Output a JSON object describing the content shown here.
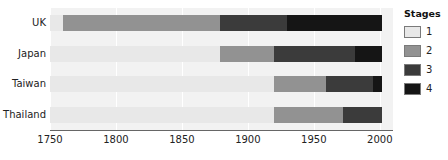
{
  "chart_data": {
    "type": "bar",
    "subtype": "stacked-horizontal-timeline",
    "title": "",
    "xlabel": "",
    "ylabel": "",
    "categories": [
      "UK",
      "Japan",
      "Taiwan",
      "Thailand"
    ],
    "xlim": [
      1750,
      2010
    ],
    "xticks": [
      1750,
      1800,
      1850,
      1900,
      1950,
      2000
    ],
    "xticklabels": [
      "1750",
      "1800",
      "1850",
      "1900",
      "1950",
      "2000"
    ],
    "grid": true,
    "grid_axis": "x",
    "legend": {
      "title": "Stages",
      "position": "right",
      "entries": [
        {
          "label": "1",
          "color": "#e8e8e8"
        },
        {
          "label": "2",
          "color": "#929292"
        },
        {
          "label": "3",
          "color": "#3b3b3b"
        },
        {
          "label": "4",
          "color": "#151515"
        }
      ]
    },
    "series": [
      {
        "name": "1",
        "color": "#e8e8e8",
        "label": "Stage 1"
      },
      {
        "name": "2",
        "color": "#929292",
        "label": "Stage 2"
      },
      {
        "name": "3",
        "color": "#3b3b3b",
        "label": "Stage 3"
      },
      {
        "name": "4",
        "color": "#151515",
        "label": "Stage 4"
      }
    ],
    "rows": [
      {
        "category": "UK",
        "segments": [
          {
            "stage": "1",
            "start": 1750,
            "end": 1760
          },
          {
            "stage": "2",
            "start": 1760,
            "end": 1879
          },
          {
            "stage": "3",
            "start": 1879,
            "end": 1930
          },
          {
            "stage": "4",
            "start": 1930,
            "end": 2002
          }
        ]
      },
      {
        "category": "Japan",
        "segments": [
          {
            "stage": "1",
            "start": 1750,
            "end": 1879
          },
          {
            "stage": "2",
            "start": 1879,
            "end": 1920
          },
          {
            "stage": "3",
            "start": 1920,
            "end": 1981
          },
          {
            "stage": "4",
            "start": 1981,
            "end": 2002
          }
        ]
      },
      {
        "category": "Taiwan",
        "segments": [
          {
            "stage": "1",
            "start": 1750,
            "end": 1920
          },
          {
            "stage": "2",
            "start": 1920,
            "end": 1959
          },
          {
            "stage": "3",
            "start": 1959,
            "end": 1995
          },
          {
            "stage": "4",
            "start": 1995,
            "end": 2002
          }
        ]
      },
      {
        "category": "Thailand",
        "segments": [
          {
            "stage": "1",
            "start": 1750,
            "end": 1920
          },
          {
            "stage": "2",
            "start": 1920,
            "end": 1972
          },
          {
            "stage": "3",
            "start": 1972,
            "end": 2002
          }
        ]
      }
    ],
    "plot_background": "#f2f2f2"
  }
}
